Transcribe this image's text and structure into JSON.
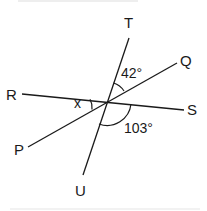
{
  "diagram": {
    "type": "intersecting-lines",
    "stroke_color": "#1a1a1a",
    "background": "#ffffff",
    "points": {
      "T": "T",
      "Q": "Q",
      "R": "R",
      "S": "S",
      "P": "P",
      "U": "U"
    },
    "lines": [
      {
        "name": "RS",
        "from": "R",
        "to": "S"
      },
      {
        "name": "PQ",
        "from": "P",
        "to": "Q"
      },
      {
        "name": "TU",
        "from": "T",
        "to": "U"
      }
    ],
    "angles": {
      "TQ": {
        "label": "42°",
        "between": [
          "T",
          "Q"
        ]
      },
      "SU": {
        "label": "103°",
        "between": [
          "S",
          "U"
        ]
      },
      "RP": {
        "label": "x",
        "between": [
          "R",
          "P"
        ]
      }
    }
  }
}
